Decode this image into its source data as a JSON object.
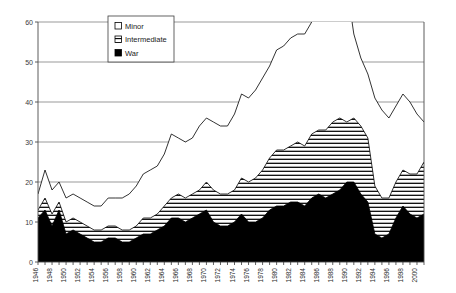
{
  "chart_data": {
    "type": "area",
    "title": "",
    "subtitle": "",
    "xlabel": "",
    "ylabel": "",
    "stacked": true,
    "grid": true,
    "legend_position": "top-center-inside",
    "xlim": [
      1946,
      2001
    ],
    "ylim": [
      0,
      60
    ],
    "yticks": [
      0,
      10,
      20,
      30,
      40,
      50,
      60
    ],
    "ytick_labels": [
      "0",
      "10",
      "20",
      "30",
      "40",
      "50",
      "60"
    ],
    "x": [
      1946,
      1947,
      1948,
      1949,
      1950,
      1951,
      1952,
      1953,
      1954,
      1955,
      1956,
      1957,
      1958,
      1959,
      1960,
      1961,
      1962,
      1963,
      1964,
      1965,
      1966,
      1967,
      1968,
      1969,
      1970,
      1971,
      1972,
      1973,
      1974,
      1975,
      1976,
      1977,
      1978,
      1979,
      1980,
      1981,
      1982,
      1983,
      1984,
      1985,
      1986,
      1987,
      1988,
      1989,
      1990,
      1991,
      1992,
      1993,
      1994,
      1995,
      1996,
      1997,
      1998,
      1999,
      2000,
      2001
    ],
    "xtick_labels": [
      "1946",
      "1948",
      "1950",
      "1952",
      "1954",
      "1956",
      "1958",
      "1960",
      "1962",
      "1964",
      "1966",
      "1968",
      "1970",
      "1972",
      "1974",
      "1976",
      "1978",
      "1980",
      "1982",
      "1984",
      "1986",
      "1988",
      "1990",
      "1992",
      "1994",
      "1996",
      "1998",
      "2000"
    ],
    "xtick_values": [
      1946,
      1948,
      1950,
      1952,
      1954,
      1956,
      1958,
      1960,
      1962,
      1964,
      1966,
      1968,
      1970,
      1972,
      1974,
      1976,
      1978,
      1980,
      1982,
      1984,
      1986,
      1988,
      1990,
      1992,
      1994,
      1996,
      1998,
      2000
    ],
    "series": [
      {
        "name": "War",
        "fill": "solid-black",
        "color": "#000000",
        "values": [
          11,
          13,
          9,
          13,
          7,
          8,
          7,
          6,
          5,
          5,
          6,
          6,
          5,
          5,
          6,
          7,
          7,
          8,
          9,
          11,
          11,
          10,
          11,
          12,
          13,
          10,
          9,
          9,
          10,
          12,
          10,
          10,
          11,
          13,
          14,
          14,
          15,
          15,
          14,
          16,
          17,
          16,
          17,
          18,
          20,
          20,
          17,
          15,
          7,
          6,
          7,
          11,
          14,
          12,
          11,
          12
        ]
      },
      {
        "name": "Intermediate",
        "fill": "horizontal-hatch",
        "color": "#ffffff",
        "values": [
          2,
          3,
          3,
          2,
          3,
          3,
          3,
          3,
          3,
          3,
          3,
          3,
          3,
          3,
          3,
          4,
          4,
          4,
          5,
          5,
          6,
          6,
          6,
          6,
          7,
          8,
          8,
          8,
          8,
          9,
          10,
          11,
          12,
          13,
          14,
          14,
          14,
          15,
          15,
          16,
          16,
          17,
          18,
          18,
          15,
          16,
          17,
          16,
          12,
          10,
          9,
          9,
          9,
          10,
          11,
          13
        ]
      },
      {
        "name": "Minor",
        "fill": "white",
        "color": "#ffffff",
        "values": [
          4,
          7,
          6,
          5,
          6,
          6,
          6,
          6,
          6,
          6,
          7,
          7,
          8,
          9,
          10,
          11,
          12,
          12,
          13,
          16,
          14,
          14,
          14,
          16,
          16,
          17,
          17,
          17,
          19,
          21,
          21,
          22,
          23,
          23,
          25,
          26,
          27,
          27,
          28,
          28,
          29,
          31,
          31,
          33,
          34,
          21,
          17,
          16,
          22,
          22,
          20,
          19,
          19,
          18,
          15,
          10
        ]
      }
    ],
    "totals": [
      17,
      23,
      18,
      20,
      16,
      17,
      16,
      15,
      14,
      14,
      16,
      16,
      16,
      17,
      19,
      22,
      23,
      24,
      27,
      32,
      31,
      30,
      31,
      34,
      36,
      35,
      34,
      34,
      37,
      42,
      41,
      43,
      46,
      49,
      53,
      54,
      56,
      57,
      57,
      60,
      62,
      64,
      66,
      69,
      69,
      57,
      51,
      47,
      41,
      38,
      36,
      39,
      42,
      40,
      37,
      35
    ]
  },
  "legend": {
    "items": [
      {
        "label": "Minor",
        "swatch": "empty-square"
      },
      {
        "label": "Intermediate",
        "swatch": "hatched-square"
      },
      {
        "label": "War",
        "swatch": "filled-square"
      }
    ]
  }
}
